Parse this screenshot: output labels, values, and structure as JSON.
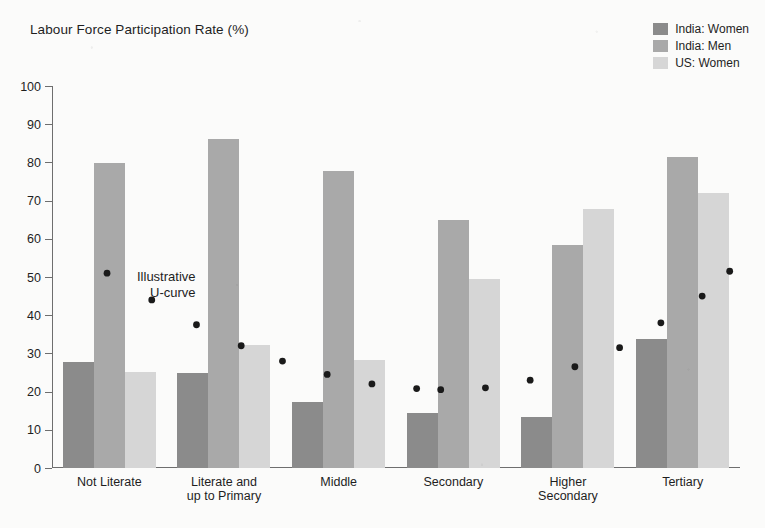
{
  "chart_data": {
    "type": "bar",
    "title": "Labour Force Participation Rate (%)",
    "xlabel": "",
    "ylabel": "",
    "ylim": [
      0,
      100
    ],
    "ytick_step": 10,
    "yticks": [
      "100",
      "90",
      "80",
      "70",
      "60",
      "50",
      "40",
      "30",
      "20",
      "10",
      "0"
    ],
    "grid": false,
    "legend_position": "top-right",
    "categories": [
      "Not Literate",
      "Literate and\nup to Primary",
      "Middle",
      "Secondary",
      "Higher\nSecondary",
      "Tertiary"
    ],
    "category_lines": [
      [
        "Not Literate"
      ],
      [
        "Literate and",
        "up to Primary"
      ],
      [
        "Middle"
      ],
      [
        "Secondary"
      ],
      [
        "Higher",
        "Secondary"
      ],
      [
        "Tertiary"
      ]
    ],
    "series": [
      {
        "name": "India: Women",
        "color": "#8b8b8b",
        "values": [
          27.8,
          24.8,
          17.4,
          14.4,
          13.3,
          33.8
        ]
      },
      {
        "name": "India: Men",
        "color": "#a9a9a9",
        "values": [
          79.9,
          86.2,
          77.7,
          64.8,
          58.5,
          81.3
        ]
      },
      {
        "name": "US: Women",
        "color": "#d6d6d6",
        "values": [
          25.2,
          32.2,
          28.4,
          49.4,
          67.9,
          72.1
        ]
      }
    ],
    "annotations": [
      {
        "name": "illustrative-u-curve",
        "lines": [
          "Illustrative",
          "U-curve"
        ],
        "style": "dotted",
        "color": "#1a1a1a",
        "curve_points": [
          {
            "x": 0.08,
            "y": 51
          },
          {
            "x": 0.145,
            "y": 44
          },
          {
            "x": 0.21,
            "y": 37.5
          },
          {
            "x": 0.275,
            "y": 32
          },
          {
            "x": 0.335,
            "y": 28
          },
          {
            "x": 0.4,
            "y": 24.5
          },
          {
            "x": 0.465,
            "y": 22
          },
          {
            "x": 0.53,
            "y": 20.8
          },
          {
            "x": 0.565,
            "y": 20.5
          },
          {
            "x": 0.63,
            "y": 21
          },
          {
            "x": 0.695,
            "y": 23
          },
          {
            "x": 0.76,
            "y": 26.5
          },
          {
            "x": 0.825,
            "y": 31.5
          },
          {
            "x": 0.885,
            "y": 38
          },
          {
            "x": 0.945,
            "y": 45
          },
          {
            "x": 0.985,
            "y": 51.5
          }
        ]
      }
    ]
  },
  "legend": {
    "items": [
      {
        "label": "India: Women",
        "color": "#8b8b8b"
      },
      {
        "label": "India: Men",
        "color": "#a9a9a9"
      },
      {
        "label": "US: Women",
        "color": "#d6d6d6"
      }
    ]
  }
}
